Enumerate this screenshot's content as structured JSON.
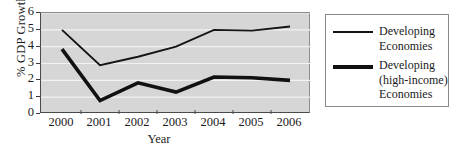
{
  "chart_data": {
    "type": "line",
    "title": "",
    "xlabel": "Year",
    "ylabel": "% GDP Growth",
    "categories": [
      "2000",
      "2001",
      "2002",
      "2003",
      "2004",
      "2005",
      "2006"
    ],
    "x": [
      2000,
      2001,
      2002,
      2003,
      2004,
      2005,
      2006
    ],
    "ylim": [
      0,
      6
    ],
    "yticks": [
      0,
      1,
      2,
      3,
      4,
      5,
      6
    ],
    "ytick_labels": [
      "0",
      "1",
      "2",
      "3",
      "4",
      "5",
      "6"
    ],
    "grid": "horizontal",
    "legend_position": "right",
    "series": [
      {
        "name": "Developing\nEconomies",
        "name_plain": "Developing Economies",
        "style": "thin",
        "color": "#141414",
        "values": [
          5.0,
          2.9,
          3.4,
          4.0,
          5.0,
          4.95,
          5.2
        ]
      },
      {
        "name": "Developing\n(high-income)\nEconomies",
        "name_plain": "Developing (high-income) Economies",
        "style": "thick",
        "color": "#111111",
        "values": [
          3.85,
          0.8,
          1.85,
          1.3,
          2.2,
          2.15,
          2.0
        ]
      }
    ]
  },
  "axes": {
    "y_title": "% GDP Growth",
    "x_title": "Year"
  },
  "legend": {
    "entries": [
      {
        "label": "Developing\nEconomies"
      },
      {
        "label": "Developing\n(high-income)\nEconomies"
      }
    ]
  },
  "colors": {
    "plot_background": "#d6d6d6",
    "gridline": "#f2f2f2",
    "axis": "#4a4a4a",
    "series_thin": "#141414",
    "series_thick": "#111111",
    "legend_border": "#8a8a8a",
    "page_background": "#ffffff"
  }
}
